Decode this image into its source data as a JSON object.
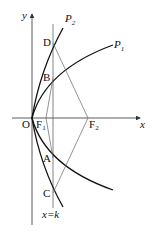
{
  "diagram": {
    "type": "geometry-figure",
    "axes": {
      "x_label": "x",
      "y_label": "y",
      "origin_label": "O"
    },
    "curves": [
      {
        "name": "P",
        "sub": "1",
        "description": "wider parabola y^2 = 2p1 x"
      },
      {
        "name": "P",
        "sub": "2",
        "description": "narrower parabola y^2 = 2p2 x"
      }
    ],
    "points": {
      "D": "D",
      "B": "B",
      "A": "A",
      "C": "C",
      "F1": {
        "main": "F",
        "sub": "1"
      },
      "F2": {
        "main": "F",
        "sub": "2"
      }
    },
    "line_label": "x=k",
    "colors": {
      "curve": "#111111",
      "line": "#555555",
      "axis": "#333333"
    }
  }
}
